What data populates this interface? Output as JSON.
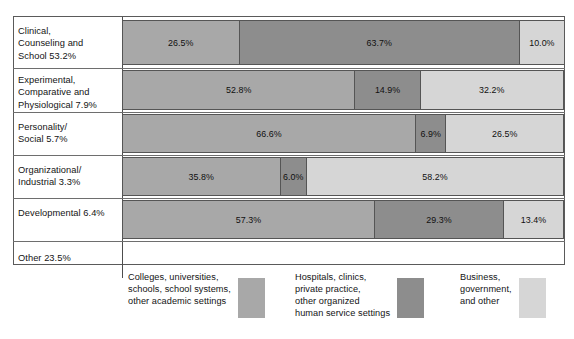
{
  "chart_data": {
    "type": "bar",
    "subtype": "horizontal-100-percent-stacked",
    "title": "",
    "xlabel": "",
    "ylabel": "",
    "xlim": [
      0,
      100
    ],
    "grid": false,
    "legend_position": "bottom",
    "categories": [
      "Clinical, Counseling and School",
      "Experimental, Comparative and Physiological",
      "Personality/ Social",
      "Organizational/ Industrial",
      "Developmental",
      "Other"
    ],
    "category_shares": [
      "53.2%",
      "7.9%",
      "5.7%",
      "3.3%",
      "6.4%",
      "23.5%"
    ],
    "series": [
      {
        "name": "Colleges, universities, schools, school systems, other academic settings",
        "color": "#a8a8a8",
        "values": [
          26.5,
          52.8,
          66.6,
          35.8,
          57.3,
          null
        ]
      },
      {
        "name": "Hospitals, clinics, private practice, other organized human service settings",
        "color": "#8d8d8d",
        "values": [
          63.7,
          14.9,
          6.9,
          6.0,
          29.3,
          null
        ]
      },
      {
        "name": "Business, government, and other",
        "color": "#d6d6d6",
        "values": [
          10.0,
          32.2,
          26.5,
          58.2,
          13.4,
          null
        ]
      }
    ]
  },
  "rows": [
    {
      "label": "Clinical,\nCounseling and\nSchool    53.2%",
      "has_bar": true,
      "segments": [
        {
          "value_label": "26.5%",
          "pct": 26.5,
          "color": "#a8a8a8"
        },
        {
          "value_label": "63.7%",
          "pct": 63.7,
          "color": "#8d8d8d"
        },
        {
          "value_label": "10.0%",
          "pct": 10.0,
          "color": "#d6d6d6"
        }
      ]
    },
    {
      "label": "Experimental,\nComparative and\n Physiological    7.9%",
      "has_bar": true,
      "segments": [
        {
          "value_label": "52.8%",
          "pct": 52.8,
          "color": "#a8a8a8"
        },
        {
          "value_label": "14.9%",
          "pct": 14.9,
          "color": "#8d8d8d"
        },
        {
          "value_label": "32.2%",
          "pct": 32.2,
          "color": "#d6d6d6"
        }
      ]
    },
    {
      "label": "Personality/\nSocial    5.7%",
      "has_bar": true,
      "segments": [
        {
          "value_label": "66.6%",
          "pct": 66.6,
          "color": "#a8a8a8"
        },
        {
          "value_label": "6.9%",
          "pct": 6.9,
          "color": "#8d8d8d"
        },
        {
          "value_label": "26.5%",
          "pct": 26.5,
          "color": "#d6d6d6"
        }
      ]
    },
    {
      "label": "Organizational/\nIndustrial    3.3%",
      "has_bar": true,
      "segments": [
        {
          "value_label": "35.8%",
          "pct": 35.8,
          "color": "#a8a8a8"
        },
        {
          "value_label": "6.0%",
          "pct": 6.0,
          "color": "#8d8d8d"
        },
        {
          "value_label": "58.2%",
          "pct": 58.2,
          "color": "#d6d6d6"
        }
      ]
    },
    {
      "label": "Developmental    6.4%",
      "has_bar": true,
      "segments": [
        {
          "value_label": "57.3%",
          "pct": 57.3,
          "color": "#a8a8a8"
        },
        {
          "value_label": "29.3%",
          "pct": 29.3,
          "color": "#8d8d8d"
        },
        {
          "value_label": "13.4%",
          "pct": 13.4,
          "color": "#d6d6d6"
        }
      ]
    },
    {
      "label": "Other    23.5%",
      "has_bar": false,
      "segments": []
    }
  ],
  "legend": [
    {
      "text": "Colleges, universities,\nschools, school systems,\nother academic settings",
      "color": "#a8a8a8"
    },
    {
      "text": "Hospitals, clinics,\nprivate practice,\nother organized\nhuman service settings",
      "color": "#8d8d8d"
    },
    {
      "text": "Business,\ngovernment,\nand other",
      "color": "#d6d6d6"
    }
  ]
}
